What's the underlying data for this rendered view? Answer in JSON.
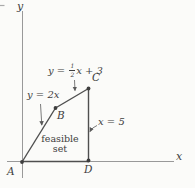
{
  "colors": {
    "background": "#fbfbf9",
    "boundary_line": "#4f4f4f",
    "axis_line": "#999999",
    "text": "#3e3e3e"
  },
  "axes": {
    "x_label": "x",
    "y_label": "y"
  },
  "vertices": {
    "a": "A",
    "b": "B",
    "c": "C",
    "d": "D"
  },
  "equations": {
    "ab_line": "y = 2x",
    "bc_line": {
      "prefix": "y = ",
      "numerator": "1",
      "denominator": "2",
      "suffix": "x + 3"
    },
    "cd_line": "x = 5"
  },
  "region_label": {
    "line1": "feasible",
    "line2": "set"
  }
}
